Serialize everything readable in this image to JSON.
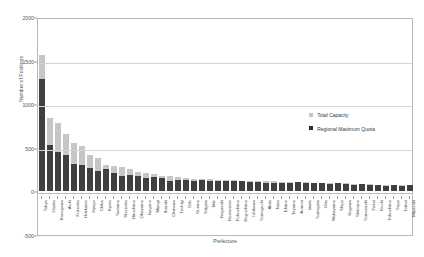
{
  "chart_data": {
    "type": "bar",
    "subtype": "stacked-vertical",
    "title": "",
    "xlabel": "Prefecture",
    "ylabel": "Number of Positions",
    "ylim": [
      -500,
      2000
    ],
    "yticks": [
      -500,
      0,
      500,
      1000,
      1500,
      2000
    ],
    "grid": true,
    "legend_position": "right",
    "colors": {
      "total_capacity": "#c6c6c6",
      "regional_maximum_quota": "#3f3f3f"
    },
    "legend": [
      "Total Capacity",
      "Regional Maximum Quota"
    ],
    "categories": [
      "Tokyo",
      "Osaka",
      "Kanagawa",
      "Aichi",
      "Fukuoka",
      "Hokkaido",
      "Hyogo",
      "Chiba",
      "Kyoto",
      "Saitama",
      "Shizuoka",
      "Hiroshima",
      "Okayama",
      "Nagano",
      "Miyagi",
      "Ibaraki",
      "Okinawa",
      "Tochigi",
      "Gifu",
      "Gunma",
      "Niigata",
      "Mie",
      "Nagasaki",
      "Kumamoto",
      "Fukushima",
      "Kagoshima",
      "Ishikawa",
      "Yamaguchi",
      "Akita",
      "Nara",
      "Ehime",
      "Toyama",
      "Aomori",
      "Iwate",
      "Yamagata",
      "Oita",
      "Wakayama",
      "Shiga",
      "Kagawa",
      "Shimane",
      "Yamanashi",
      "Fukui",
      "Kochi",
      "Tokushima",
      "Saga",
      "Tottori",
      "Miyazaki"
    ],
    "series": [
      {
        "name": "Regional Maximum Quota",
        "color": "#3f3f3f",
        "values": [
          1290,
          530,
          455,
          420,
          320,
          300,
          265,
          235,
          255,
          210,
          180,
          185,
          175,
          150,
          170,
          150,
          120,
          135,
          130,
          125,
          135,
          120,
          115,
          120,
          125,
          115,
          105,
          110,
          95,
          100,
          100,
          95,
          105,
          100,
          95,
          95,
          80,
          100,
          90,
          70,
          80,
          75,
          70,
          65,
          75,
          60,
          70
        ]
      },
      {
        "name": "Total Capacity",
        "color": "#c6c6c6",
        "stack_increment": [
          270,
          310,
          335,
          235,
          240,
          225,
          150,
          145,
          50,
          80,
          105,
          75,
          45,
          60,
          25,
          30,
          55,
          25,
          20,
          20,
          5,
          20,
          20,
          15,
          5,
          10,
          15,
          10,
          20,
          15,
          10,
          10,
          0,
          5,
          5,
          5,
          15,
          0,
          5,
          15,
          5,
          5,
          5,
          5,
          0,
          10,
          0
        ],
        "totals": [
          1560,
          840,
          790,
          655,
          560,
          525,
          415,
          380,
          305,
          290,
          285,
          260,
          220,
          210,
          195,
          180,
          175,
          160,
          150,
          145,
          140,
          140,
          135,
          135,
          130,
          125,
          120,
          120,
          115,
          115,
          110,
          105,
          105,
          105,
          100,
          100,
          95,
          100,
          95,
          85,
          85,
          80,
          75,
          70,
          75,
          70,
          70
        ]
      }
    ]
  },
  "axes": {
    "ytitle": "Number of Positions",
    "xtitle": "Prefecture",
    "ytick_labels": [
      "2000",
      "1500",
      "1000",
      "500",
      "0",
      "-500"
    ]
  },
  "legend": {
    "items": [
      {
        "label": "Total Capacity",
        "swatch": "light-gray-swatch"
      },
      {
        "label": "Regional Maximum Quota",
        "swatch": "dark-swatch"
      }
    ]
  }
}
